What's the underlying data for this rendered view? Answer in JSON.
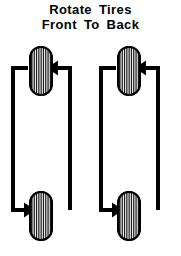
{
  "page": {
    "width": 181,
    "height": 256,
    "background_color": "#ffffff",
    "ink_color": "#000000"
  },
  "title": {
    "line1": "Rotate  Tires",
    "line2": "Front  To  Back",
    "full_text": "Rotate Tires Front To Back",
    "color": "#000000",
    "font_size_px": 13,
    "weight": "bold",
    "align": "center"
  },
  "diagram": {
    "type": "tire-rotation-pattern",
    "stroke_color": "#000000",
    "stroke_width_px": 4,
    "groups": [
      {
        "name": "left-side-group",
        "label": "driver side",
        "offset_x": 0,
        "tires": [
          {
            "position": "front-left",
            "cx": 41,
            "cy": 71,
            "rx": 11,
            "ry": 24,
            "tread_stripes": 8
          },
          {
            "position": "rear-left",
            "cx": 41,
            "cy": 216,
            "rx": 11,
            "ry": 24,
            "tread_stripes": 8
          }
        ],
        "arrows": [
          {
            "name": "rear-to-front-arrow",
            "from": "rear-left",
            "to": "front-left",
            "direction": "left",
            "arrowhead": true,
            "path": "M 70 210 L 70 68 L 57 68"
          },
          {
            "name": "front-to-rear-arrow",
            "from": "front-left",
            "to": "rear-left",
            "direction": "right",
            "arrowhead": true,
            "path": "M 28 68 L 13 68 L 13 210 L 25 210"
          }
        ],
        "connectors": [
          {
            "name": "top-left-corner",
            "arrowhead": false
          },
          {
            "name": "bottom-right-corner",
            "arrowhead": false
          }
        ]
      },
      {
        "name": "right-side-group",
        "label": "passenger side",
        "offset_x": 88,
        "tires": [
          {
            "position": "front-right",
            "cx": 129,
            "cy": 71,
            "rx": 11,
            "ry": 24,
            "tread_stripes": 8
          },
          {
            "position": "rear-right",
            "cx": 129,
            "cy": 216,
            "rx": 11,
            "ry": 24,
            "tread_stripes": 8
          }
        ],
        "arrows": [
          {
            "name": "rear-to-front-arrow",
            "from": "rear-right",
            "to": "front-right",
            "direction": "left",
            "arrowhead": true,
            "path": "M 158 210 L 158 68 L 145 68"
          },
          {
            "name": "front-to-rear-arrow",
            "from": "front-right",
            "to": "rear-right",
            "direction": "right",
            "arrowhead": true,
            "path": "M 116 68 L 101 68 L 101 210 L 113 210"
          }
        ],
        "connectors": [
          {
            "name": "top-left-corner",
            "arrowhead": false
          },
          {
            "name": "bottom-right-corner",
            "arrowhead": false
          }
        ]
      }
    ]
  }
}
